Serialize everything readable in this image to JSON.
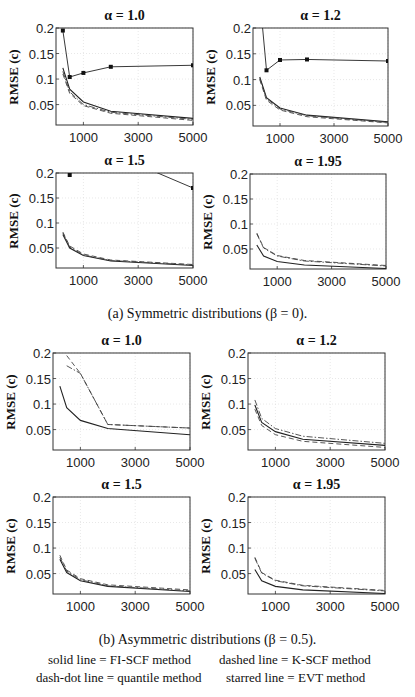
{
  "figure": {
    "caption_a": "(a) Symmetric distributions (β = 0).",
    "caption_b": "(b) Asymmetric distributions (β = 0.5).",
    "ylabel": "RMSE (c)",
    "legend": {
      "solid": "solid line = FI-SCF method",
      "dashed": "dashed line = K-SCF method",
      "dashdot": "dash-dot line = quantile method",
      "starred": "starred line = EVT method"
    },
    "x_ticks": [
      "1000",
      "3000",
      "5000"
    ],
    "y_ticks": [
      "0.2",
      "0.15",
      "0.1",
      "0.05"
    ]
  },
  "chart_data": [
    {
      "type": "line",
      "group": "a",
      "title": "α = 1.0",
      "xlabel": "",
      "ylabel": "RMSE (c)",
      "xlim": [
        0,
        5000
      ],
      "ylim": [
        0.01,
        0.2
      ],
      "grid": true,
      "x": [
        250,
        500,
        1000,
        2000,
        5000
      ],
      "series": [
        {
          "name": "FI-SCF",
          "style": "solid",
          "values": [
            0.122,
            0.08,
            0.055,
            0.037,
            0.023
          ]
        },
        {
          "name": "K-SCF",
          "style": "dashed",
          "values": [
            0.11,
            0.072,
            0.048,
            0.033,
            0.019
          ]
        },
        {
          "name": "quantile",
          "style": "dashdot",
          "values": [
            0.115,
            0.075,
            0.05,
            0.035,
            0.021
          ]
        },
        {
          "name": "EVT",
          "style": "starred",
          "values": [
            0.195,
            0.104,
            0.112,
            0.124,
            0.127
          ]
        }
      ]
    },
    {
      "type": "line",
      "group": "a",
      "title": "α = 1.2",
      "xlabel": "",
      "ylabel": "RMSE (c)",
      "xlim": [
        0,
        5000
      ],
      "ylim": [
        0.01,
        0.2
      ],
      "grid": true,
      "x": [
        250,
        500,
        1000,
        2000,
        5000
      ],
      "series": [
        {
          "name": "FI-SCF",
          "style": "solid",
          "values": [
            0.105,
            0.065,
            0.045,
            0.031,
            0.018
          ]
        },
        {
          "name": "K-SCF",
          "style": "dashed",
          "values": [
            0.1,
            0.06,
            0.041,
            0.028,
            0.016
          ]
        },
        {
          "name": "quantile",
          "style": "dashdot",
          "values": [
            0.102,
            0.063,
            0.043,
            0.03,
            0.017
          ]
        },
        {
          "name": "EVT",
          "style": "starred",
          "values": [
            0.26,
            0.118,
            0.138,
            0.139,
            0.136
          ]
        }
      ]
    },
    {
      "type": "line",
      "group": "a",
      "title": "α = 1.5",
      "xlabel": "",
      "ylabel": "RMSE (c)",
      "xlim": [
        0,
        5000
      ],
      "ylim": [
        0.01,
        0.2
      ],
      "grid": true,
      "x": [
        250,
        500,
        1000,
        2000,
        5000
      ],
      "series": [
        {
          "name": "FI-SCF",
          "style": "solid",
          "values": [
            0.077,
            0.05,
            0.035,
            0.024,
            0.015
          ]
        },
        {
          "name": "K-SCF",
          "style": "dashed",
          "values": [
            0.082,
            0.054,
            0.038,
            0.026,
            0.017
          ]
        },
        {
          "name": "quantile",
          "style": "dashdot",
          "values": [
            0.08,
            0.052,
            0.036,
            0.025,
            0.016
          ]
        },
        {
          "name": "EVT",
          "style": "starred",
          "values": [
            0.5,
            0.196,
            0.3,
            0.24,
            0.17
          ]
        }
      ]
    },
    {
      "type": "line",
      "group": "a",
      "title": "α = 1.95",
      "xlabel": "",
      "ylabel": "RMSE (c)",
      "xlim": [
        0,
        5000
      ],
      "ylim": [
        0.01,
        0.2
      ],
      "grid": true,
      "x": [
        250,
        500,
        1000,
        2000,
        5000
      ],
      "series": [
        {
          "name": "FI-SCF",
          "style": "solid",
          "values": [
            0.058,
            0.036,
            0.025,
            0.018,
            0.011
          ]
        },
        {
          "name": "K-SCF",
          "style": "dashed",
          "values": [
            0.082,
            0.053,
            0.037,
            0.027,
            0.017
          ]
        },
        {
          "name": "quantile",
          "style": "dashdot",
          "values": [
            0.08,
            0.052,
            0.036,
            0.026,
            0.016
          ]
        }
      ]
    },
    {
      "type": "line",
      "group": "b",
      "title": "α = 1.0",
      "xlabel": "",
      "ylabel": "RMSE (c)",
      "xlim": [
        0,
        5000
      ],
      "ylim": [
        0.01,
        0.2
      ],
      "grid": true,
      "x": [
        250,
        500,
        1000,
        2000,
        5000
      ],
      "series": [
        {
          "name": "FI-SCF",
          "style": "solid",
          "values": [
            0.135,
            0.093,
            0.068,
            0.052,
            0.04
          ]
        },
        {
          "name": "K-SCF",
          "style": "dashed",
          "values": [
            null,
            0.195,
            0.16,
            0.06,
            0.053
          ]
        },
        {
          "name": "quantile",
          "style": "dashdot",
          "values": [
            null,
            0.175,
            0.16,
            0.06,
            0.053
          ]
        }
      ]
    },
    {
      "type": "line",
      "group": "b",
      "title": "α = 1.2",
      "xlabel": "",
      "ylabel": "RMSE (c)",
      "xlim": [
        0,
        5000
      ],
      "ylim": [
        0.01,
        0.2
      ],
      "grid": true,
      "x": [
        250,
        500,
        1000,
        2000,
        5000
      ],
      "series": [
        {
          "name": "FI-SCF",
          "style": "solid",
          "values": [
            0.098,
            0.064,
            0.046,
            0.031,
            0.019
          ]
        },
        {
          "name": "K-SCF",
          "style": "dashed",
          "values": [
            0.09,
            0.058,
            0.04,
            0.027,
            0.015
          ]
        },
        {
          "name": "quantile",
          "style": "dashdot",
          "values": [
            0.108,
            0.072,
            0.052,
            0.037,
            0.023
          ]
        }
      ]
    },
    {
      "type": "line",
      "group": "b",
      "title": "α = 1.5",
      "xlabel": "",
      "ylabel": "RMSE (c)",
      "xlim": [
        0,
        5000
      ],
      "ylim": [
        0.01,
        0.2
      ],
      "grid": true,
      "x": [
        250,
        500,
        1000,
        2000,
        5000
      ],
      "series": [
        {
          "name": "FI-SCF",
          "style": "solid",
          "values": [
            0.078,
            0.052,
            0.036,
            0.025,
            0.015
          ]
        },
        {
          "name": "K-SCF",
          "style": "dashed",
          "values": [
            0.086,
            0.057,
            0.04,
            0.028,
            0.018
          ]
        },
        {
          "name": "quantile",
          "style": "dashdot",
          "values": [
            0.082,
            0.055,
            0.038,
            0.026,
            0.016
          ]
        }
      ]
    },
    {
      "type": "line",
      "group": "b",
      "title": "α = 1.95",
      "xlabel": "",
      "ylabel": "RMSE (c)",
      "xlim": [
        0,
        5000
      ],
      "ylim": [
        0.01,
        0.2
      ],
      "grid": true,
      "x": [
        250,
        500,
        1000,
        2000,
        5000
      ],
      "series": [
        {
          "name": "FI-SCF",
          "style": "solid",
          "values": [
            0.058,
            0.036,
            0.025,
            0.018,
            0.011
          ]
        },
        {
          "name": "K-SCF",
          "style": "dashed",
          "values": [
            0.082,
            0.052,
            0.037,
            0.027,
            0.017
          ]
        },
        {
          "name": "quantile",
          "style": "dashdot",
          "values": [
            0.08,
            0.051,
            0.036,
            0.026,
            0.016
          ]
        }
      ]
    }
  ]
}
